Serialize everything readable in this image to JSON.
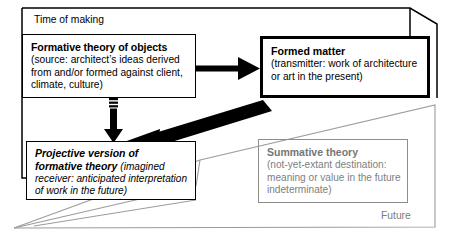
{
  "diagram": {
    "frames": [
      {
        "id": "time-of-making",
        "label": "Time of making",
        "color": "#000000",
        "style": "solid-black-perspective-frame"
      },
      {
        "id": "future",
        "label": "Future",
        "color": "#8d8d8d",
        "style": "solid-grey-perspective-frame"
      }
    ],
    "nodes": [
      {
        "id": "formative-theory-of-objects",
        "heading": "Formative theory of objects",
        "body": "(source: architect’s ideas derived from and/or formed against client, climate, culture)",
        "body_lines": [
          "(source: architect’s ideas derived",
          "from and/or formed against client,",
          "climate, culture)"
        ],
        "border_color": "#000000",
        "text_color": "#000000",
        "emphasis": "normal"
      },
      {
        "id": "formed-matter",
        "heading": "Formed matter",
        "body": "(transmitter: work of architecture or art in the present)",
        "body_lines": [
          "(transmitter: work of architecture",
          "or art in the present)"
        ],
        "border_color": "#000000",
        "text_color": "#000000",
        "emphasis": "thick-border"
      },
      {
        "id": "projective-version-of-formative-theory",
        "heading_lines": [
          "Projective version of",
          "formative theory"
        ],
        "heading": "Projective version of formative theory",
        "body": "(imagined receiver: anticipated interpretation of work in the future)",
        "body_lines": [
          "(imagined",
          "receiver: anticipated interpretation",
          "of work in the future)"
        ],
        "border_color": "#000000",
        "text_color": "#000000",
        "emphasis": "italic"
      },
      {
        "id": "summative-theory",
        "heading": "Summative theory",
        "body": "(not-yet-extant destination: meaning or value in the future indeterminate)",
        "body_lines": [
          "(not-yet-extant destination:",
          "meaning or value in the future",
          "indeterminate)"
        ],
        "border_color": "#8d8d8d",
        "text_color": "#808080",
        "emphasis": "greyed"
      }
    ],
    "arrows": [
      {
        "id": "formative-to-formed",
        "from": "formative-theory-of-objects",
        "to": "formed-matter",
        "direction": "right",
        "style": "solid-thick-black"
      },
      {
        "id": "formative-to-projective",
        "from": "formative-theory-of-objects",
        "to": "projective-version-of-formative-theory",
        "direction": "down",
        "style": "striped-shaft-black"
      },
      {
        "id": "formed-to-projective",
        "from": "formed-matter",
        "to": "projective-version-of-formative-theory",
        "direction": "diagonal-down-left",
        "style": "solid-very-thick-black"
      }
    ]
  }
}
